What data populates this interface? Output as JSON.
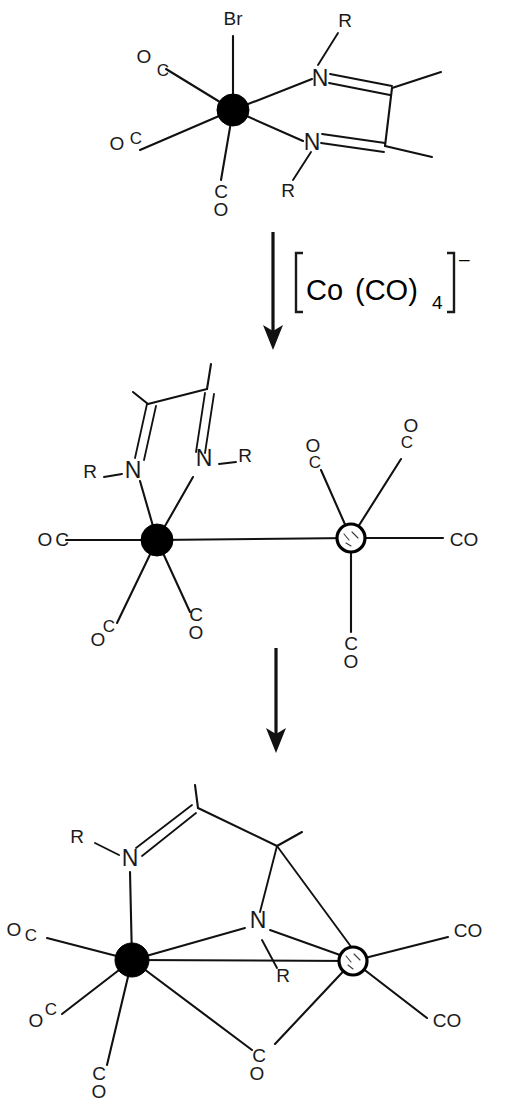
{
  "diagram": {
    "type": "chemical-reaction-scheme",
    "steps": 3,
    "colors": {
      "ink": "#111111",
      "background": "#ffffff",
      "filled_metal": "#000000",
      "open_metal_fill": "#ffffff"
    }
  },
  "structure_top": {
    "name": "starting-complex",
    "description": "Octahedral manganese complex with bromide, three carbonyls and a chelating diazabutadiene ligand",
    "labels": {
      "bromide": "Br",
      "co_upper_left": {
        "o": "O",
        "c": "C"
      },
      "co_lower_left": {
        "o": "O",
        "c": "C"
      },
      "co_bottom": {
        "c": "C",
        "o": "O"
      },
      "n_upper": "N",
      "n_lower": "N",
      "r_upper": "R",
      "r_lower": "R"
    }
  },
  "reagent": {
    "name": "tetracarbonylcobaltate",
    "bracket_open": "[",
    "bracket_close": "]",
    "formula_part1": "Co",
    "formula_part2": "(CO)",
    "subscript": "4",
    "charge": "–",
    "full_text": "[Co(CO)4]–"
  },
  "arrows": [
    {
      "name": "arrow-step-1",
      "direction": "down"
    },
    {
      "name": "arrow-step-2",
      "direction": "down"
    }
  ],
  "structure_middle": {
    "name": "bimetallic-intermediate",
    "description": "Manganese centre bearing chelating diazabutadiene and three carbonyls bonded to a cobalt centre bearing three carbonyls",
    "labels": {
      "r_left": "R",
      "n_left": "N",
      "n_right": "N",
      "r_right": "R",
      "mn_co_left": {
        "o": "O",
        "c": "C"
      },
      "mn_co_lower_left": {
        "o": "O",
        "c": "C"
      },
      "mn_co_lower_right": {
        "c": "C",
        "o": "O"
      },
      "co_co_upper_left": {
        "o": "O",
        "c": "C"
      },
      "co_co_upper_right": {
        "c": "C",
        "o": "O"
      },
      "co_co_right": "CO",
      "co_co_bottom": {
        "c": "C",
        "o": "O"
      }
    }
  },
  "structure_bottom": {
    "name": "bridged-product",
    "description": "Bridged bimetallic complex with an amido nitrogen and a bridging carbonyl spanning both metals",
    "labels": {
      "r_top": "R",
      "n_top": "N",
      "n_bridge": "N",
      "r_bridge": "R",
      "mn_co_left": {
        "o": "O",
        "c": "C"
      },
      "mn_co_lower_left": {
        "o": "O",
        "c": "C"
      },
      "mn_co_bottom": {
        "c": "C",
        "o": "O"
      },
      "bridge_co": {
        "c": "C",
        "o": "O"
      },
      "co_co_upper_right": "CO",
      "co_co_lower_right": "CO"
    }
  }
}
